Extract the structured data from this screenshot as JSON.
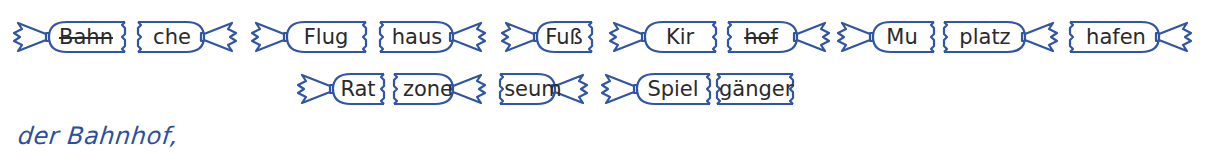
{
  "exercise": {
    "stroke_color": "#2f55a4",
    "text_color": "#2a2a2a",
    "answer_color": "#2b4fa0",
    "row1": [
      {
        "text": "Bahn",
        "type": "left-half",
        "struck": true
      },
      {
        "text": "che",
        "type": "right-half",
        "struck": false
      },
      {
        "text": "Flug",
        "type": "left-half",
        "struck": false
      },
      {
        "text": "haus",
        "type": "right-half",
        "struck": false
      },
      {
        "text": "Fuß",
        "type": "left-half",
        "struck": false
      },
      {
        "text": "Kir",
        "type": "left-half",
        "struck": false
      },
      {
        "text": "hof",
        "type": "right-half",
        "struck": true
      },
      {
        "text": "Mu",
        "type": "left-half",
        "struck": false
      },
      {
        "text": "platz",
        "type": "right-half",
        "struck": false
      },
      {
        "text": "hafen",
        "type": "right-half",
        "struck": false
      }
    ],
    "row2": [
      {
        "text": "Rat",
        "type": "left-half",
        "struck": false
      },
      {
        "text": "zone",
        "type": "right-half",
        "struck": false
      },
      {
        "text": "seum",
        "type": "right-half",
        "struck": false
      },
      {
        "text": "Spiel",
        "type": "left-half",
        "struck": false
      },
      {
        "text": "gänger",
        "type": "middle",
        "struck": false
      }
    ],
    "answer_text": "der Bahnhof,"
  }
}
